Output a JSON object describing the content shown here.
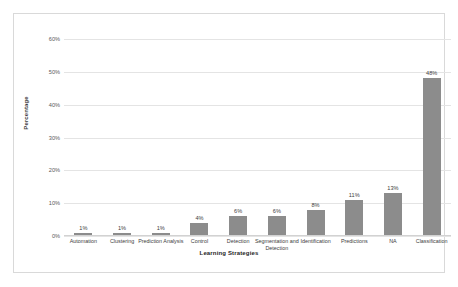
{
  "chart_data": {
    "type": "bar",
    "title": "",
    "xlabel": "Learning Strategies",
    "ylabel": "Percentage",
    "categories": [
      "Automation",
      "Clustering",
      "Prediction Analysis",
      "Control",
      "Detection",
      "Segmentation and Detection",
      "Identification",
      "Predictions",
      "NA",
      "Classification"
    ],
    "values": [
      1,
      1,
      1,
      4,
      6,
      6,
      8,
      11,
      13,
      48
    ],
    "data_labels": [
      "1%",
      "1%",
      "1%",
      "4%",
      "6%",
      "6%",
      "8%",
      "11%",
      "13%",
      "48%"
    ],
    "ylim": [
      0,
      60
    ],
    "ytick_values": [
      0,
      10,
      20,
      30,
      40,
      50,
      60
    ],
    "ytick_labels": [
      "0%",
      "10%",
      "20%",
      "30%",
      "40%",
      "50%",
      "60%"
    ],
    "grid": true,
    "legend": false,
    "bar_color": "#8c8c8c",
    "gridline_color": "#e4e4e4",
    "border_color": "#d9d9d9",
    "background_color": "#ffffff"
  }
}
